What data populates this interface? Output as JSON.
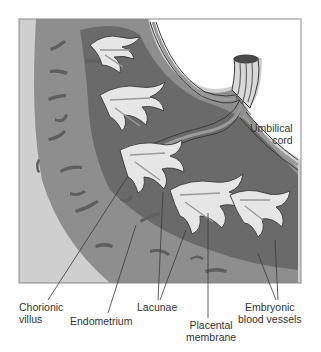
{
  "figure": {
    "colors": {
      "background": "#ffffff",
      "frame_border": "#8a8a8a",
      "outer_wall_light": "#cfcfcf",
      "endometrium": "#8e8e8e",
      "endometrium_gland": "#5e5e5e",
      "lacunae": "#6a6a6a",
      "villus_outline": "#3a3a3a",
      "villus_fill": "#e6e6e6",
      "vessel": "#9a9a9a",
      "leader_line": "#3a3a3a"
    }
  },
  "labels": {
    "umbilical_cord": "Umbilical\ncord",
    "chorionic_villus": "Chorionic\nvillus",
    "endometrium": "Endometrium",
    "lacunae": "Lacunae",
    "placental_membrane": "Placental\nmembrane",
    "embryonic_blood_vessels": "Embryonic\nblood vessels"
  }
}
